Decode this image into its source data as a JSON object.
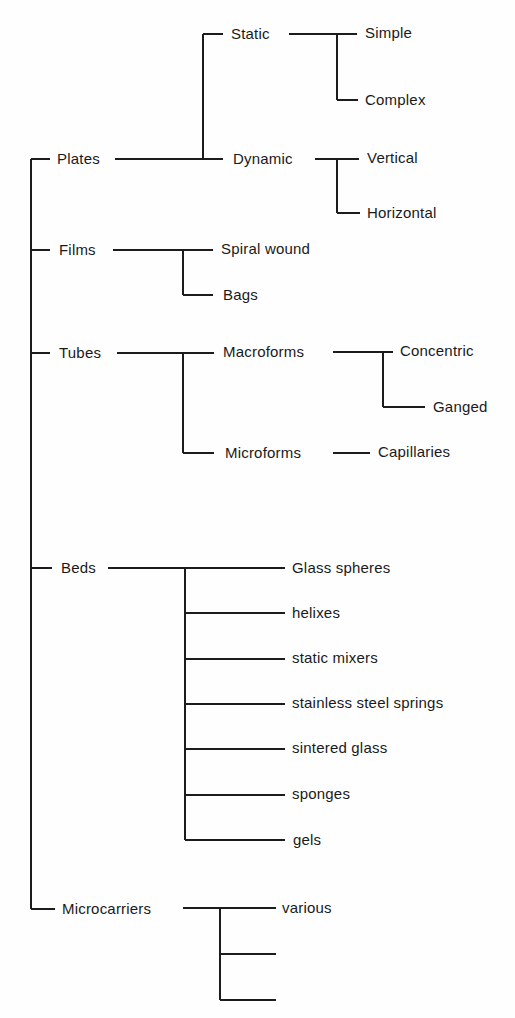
{
  "diagram": {
    "type": "tree",
    "colors": {
      "line": "#1c1c1c",
      "text": "#1a1a1a",
      "background": "#fefefe"
    },
    "root_children": [
      {
        "label": "Plates",
        "children": [
          {
            "label": "Static",
            "children": [
              {
                "label": "Simple"
              },
              {
                "label": "Complex"
              }
            ]
          },
          {
            "label": "Dynamic",
            "children": [
              {
                "label": "Vertical"
              },
              {
                "label": "Horizontal"
              }
            ]
          }
        ]
      },
      {
        "label": "Films",
        "children": [
          {
            "label": "Spiral wound"
          },
          {
            "label": "Bags"
          }
        ]
      },
      {
        "label": "Tubes",
        "children": [
          {
            "label": "Macroforms",
            "children": [
              {
                "label": "Concentric"
              },
              {
                "label": "Ganged"
              }
            ]
          },
          {
            "label": "Microforms",
            "children": [
              {
                "label": "Capillaries"
              }
            ]
          }
        ]
      },
      {
        "label": "Beds",
        "children": [
          {
            "label": "Glass spheres"
          },
          {
            "label": "helixes"
          },
          {
            "label": "static mixers"
          },
          {
            "label": "stainless steel springs"
          },
          {
            "label": "sintered glass"
          },
          {
            "label": "sponges"
          },
          {
            "label": "gels"
          }
        ]
      },
      {
        "label": "Microcarriers",
        "children": [
          {
            "label": "various"
          },
          {
            "label": ""
          },
          {
            "label": ""
          }
        ]
      }
    ]
  }
}
